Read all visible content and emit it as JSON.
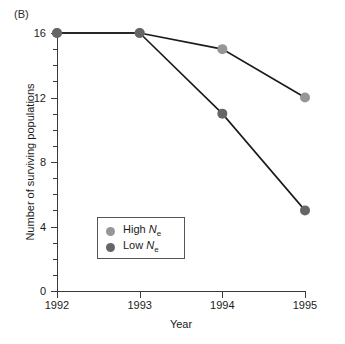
{
  "panel": {
    "label": "(B)"
  },
  "chart_data": {
    "type": "line",
    "title": "",
    "panel_label": "(B)",
    "xlabel": "Year",
    "ylabel": "Number of surviving populations",
    "categories": [
      "1992",
      "1993",
      "1994",
      "1995"
    ],
    "x": [
      1992,
      1993,
      1994,
      1995
    ],
    "xlim": [
      1992,
      1995
    ],
    "ylim": [
      0,
      16
    ],
    "yticks": [
      0,
      4,
      8,
      12,
      16
    ],
    "ytick_labels": [
      "0",
      "4",
      "8",
      "12",
      "16"
    ],
    "y_minor_tick_step": 1,
    "xticks": [
      1992,
      1993,
      1994,
      1995
    ],
    "xtick_labels": [
      "1992",
      "1993",
      "1994",
      "1995"
    ],
    "grid": false,
    "legend_position": "lower-left",
    "series": [
      {
        "name": "High Ne",
        "legend_name_main": "High ",
        "legend_italic": "N",
        "legend_sub": "e",
        "color": "#969696",
        "line_color": "#1a1a1a",
        "values": [
          16,
          16,
          15,
          12
        ]
      },
      {
        "name": "Low Ne",
        "legend_name_main": "Low ",
        "legend_italic": "N",
        "legend_sub": "e",
        "color": "#666666",
        "line_color": "#1a1a1a",
        "values": [
          16,
          16,
          11,
          5
        ]
      }
    ]
  },
  "colors": {
    "high_ne": "#969696",
    "low_ne": "#666666",
    "axis": "#3a3a3a",
    "line": "#1a1a1a",
    "background": "#ffffff"
  }
}
